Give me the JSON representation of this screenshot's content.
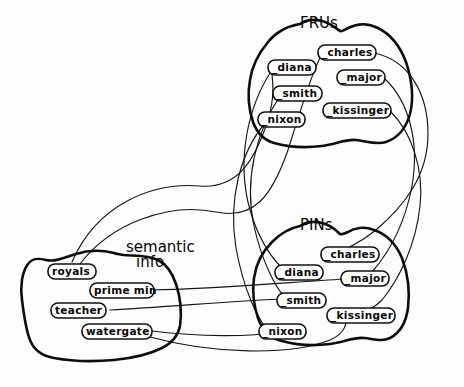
{
  "diagram": {
    "stroke_color": "#0d0d0d",
    "link_color": "#161616",
    "background_color": "#ffffff"
  },
  "sets": {
    "frus": {
      "label": "FRUs",
      "nodes": [
        {
          "id": "frus-charles",
          "label": "_charles",
          "x": 322,
          "y": 48
        },
        {
          "id": "frus-diana",
          "label": "_diana",
          "x": 272,
          "y": 63
        },
        {
          "id": "frus-major",
          "label": "_major",
          "x": 341,
          "y": 73
        },
        {
          "id": "frus-smith",
          "label": "_smith",
          "x": 277,
          "y": 89
        },
        {
          "id": "frus-kissinger",
          "label": "_kissinger",
          "x": 327,
          "y": 106
        },
        {
          "id": "frus-nixon",
          "label": "_nixon",
          "x": 262,
          "y": 115
        }
      ]
    },
    "pins": {
      "label": "PINs",
      "nodes": [
        {
          "id": "pins-charles",
          "label": "_charles",
          "x": 325,
          "y": 250
        },
        {
          "id": "pins-diana",
          "label": "_diana",
          "x": 279,
          "y": 268
        },
        {
          "id": "pins-major",
          "label": "_major",
          "x": 345,
          "y": 274
        },
        {
          "id": "pins-smith",
          "label": "_smith",
          "x": 281,
          "y": 296
        },
        {
          "id": "pins-kissinger",
          "label": "_kissinger",
          "x": 331,
          "y": 311
        },
        {
          "id": "pins-nixon",
          "label": "_nixon",
          "x": 263,
          "y": 327
        }
      ]
    },
    "semantic_info": {
      "label": "semantic\ninfo",
      "label_line1": "semantic",
      "label_line2": "info",
      "nodes": [
        {
          "id": "sem-royals",
          "label": "royals",
          "x": 52,
          "y": 267
        },
        {
          "id": "sem-prime-min",
          "label": "prime min",
          "x": 94,
          "y": 286
        },
        {
          "id": "sem-teacher",
          "label": "teacher",
          "x": 55,
          "y": 306
        },
        {
          "id": "sem-watergate",
          "label": "watergate",
          "x": 86,
          "y": 327
        }
      ]
    }
  },
  "edges": [
    {
      "from": "sem-royals",
      "to": "frus-diana"
    },
    {
      "from": "sem-royals",
      "to": "frus-charles"
    },
    {
      "from": "sem-prime-min",
      "to": "pins-major"
    },
    {
      "from": "sem-teacher",
      "to": "pins-smith"
    },
    {
      "from": "sem-watergate",
      "to": "pins-nixon"
    },
    {
      "from": "sem-watergate",
      "to": "pins-kissinger"
    },
    {
      "from": "frus-diana",
      "to": "pins-diana"
    },
    {
      "from": "frus-smith",
      "to": "pins-smith"
    },
    {
      "from": "frus-nixon",
      "to": "pins-nixon"
    },
    {
      "from": "frus-charles",
      "to": "pins-charles"
    },
    {
      "from": "frus-major",
      "to": "pins-major"
    },
    {
      "from": "frus-kissinger",
      "to": "pins-kissinger"
    }
  ]
}
